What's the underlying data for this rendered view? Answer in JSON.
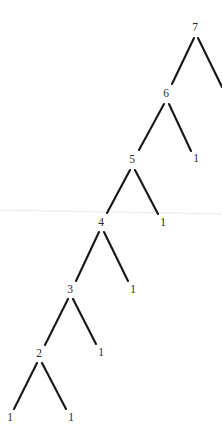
{
  "figure": {
    "name": "recursion-tree",
    "type": "binary-tree-diagram",
    "width": 222,
    "height": 447,
    "background_color": "#ffffff",
    "edge_color": "#161616",
    "label_color": "#2b2b2b",
    "scan_line_color": "#f0f0f2"
  },
  "nodes": [
    {
      "id": "n7",
      "label": "7",
      "x": 195,
      "y": 28
    },
    {
      "id": "n7r",
      "label": "",
      "x": 228,
      "y": 95
    },
    {
      "id": "n6",
      "label": "6",
      "x": 166,
      "y": 94
    },
    {
      "id": "n6r",
      "label": "1",
      "x": 196,
      "y": 159
    },
    {
      "id": "n5",
      "label": "5",
      "x": 132,
      "y": 160
    },
    {
      "id": "n5r",
      "label": "1",
      "x": 163,
      "y": 223
    },
    {
      "id": "n4",
      "label": "4",
      "x": 101,
      "y": 223
    },
    {
      "id": "n4r",
      "label": "1",
      "x": 133,
      "y": 290
    },
    {
      "id": "n3",
      "label": "3",
      "x": 70,
      "y": 290
    },
    {
      "id": "n3r",
      "label": "1",
      "x": 101,
      "y": 353
    },
    {
      "id": "n2",
      "label": "2",
      "x": 39,
      "y": 354
    },
    {
      "id": "n2l",
      "label": "1",
      "x": 10,
      "y": 418
    },
    {
      "id": "n2r",
      "label": "1",
      "x": 71,
      "y": 418
    }
  ],
  "edges": [
    {
      "from": "n7",
      "to": "n6",
      "x1": 194,
      "y1": 38,
      "x2": 172,
      "y2": 84
    },
    {
      "from": "n7",
      "to": "n7r",
      "x1": 198,
      "y1": 38,
      "x2": 222,
      "y2": 87
    },
    {
      "from": "n6",
      "to": "n5",
      "x1": 164,
      "y1": 104,
      "x2": 139,
      "y2": 150
    },
    {
      "from": "n6",
      "to": "n6r",
      "x1": 169,
      "y1": 104,
      "x2": 191,
      "y2": 151
    },
    {
      "from": "n5",
      "to": "n4",
      "x1": 130,
      "y1": 170,
      "x2": 107,
      "y2": 213
    },
    {
      "from": "n5",
      "to": "n5r",
      "x1": 135,
      "y1": 170,
      "x2": 158,
      "y2": 214
    },
    {
      "from": "n4",
      "to": "n3",
      "x1": 99,
      "y1": 232,
      "x2": 76,
      "y2": 281
    },
    {
      "from": "n4",
      "to": "n4r",
      "x1": 104,
      "y1": 232,
      "x2": 128,
      "y2": 281
    },
    {
      "from": "n3",
      "to": "n2",
      "x1": 68,
      "y1": 299,
      "x2": 45,
      "y2": 345
    },
    {
      "from": "n3",
      "to": "n3r",
      "x1": 73,
      "y1": 299,
      "x2": 96,
      "y2": 344
    },
    {
      "from": "n2",
      "to": "n2l",
      "x1": 37,
      "y1": 363,
      "x2": 14,
      "y2": 409
    },
    {
      "from": "n2",
      "to": "n2r",
      "x1": 42,
      "y1": 363,
      "x2": 66,
      "y2": 409
    }
  ],
  "scan_line": {
    "x1": 0,
    "y1": 210,
    "x2": 222,
    "y2": 214
  }
}
